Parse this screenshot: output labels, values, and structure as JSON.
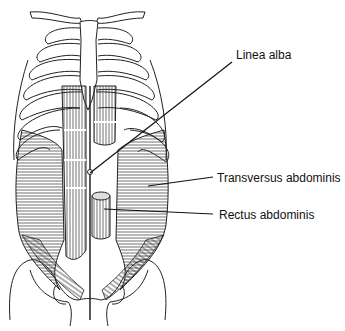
{
  "figure": {
    "labels": [
      {
        "id": "linea-alba",
        "text": "Linea alba",
        "x": 236,
        "y": 48
      },
      {
        "id": "transversus-abdominis",
        "text": "Transversus abdominis",
        "x": 217,
        "y": 171
      },
      {
        "id": "rectus-abdominis",
        "text": "Rectus abdominis",
        "x": 219,
        "y": 208
      }
    ],
    "leaders": [
      {
        "for": "linea-alba",
        "x1": 232,
        "y1": 62,
        "x2": 90,
        "y2": 173
      },
      {
        "for": "transversus-abdominis",
        "x1": 213,
        "y1": 177,
        "x2": 148,
        "y2": 186
      },
      {
        "for": "rectus-abdominis",
        "x1": 213,
        "y1": 214,
        "x2": 104,
        "y2": 209
      }
    ],
    "colors": {
      "line": "#111111",
      "background": "#ffffff"
    }
  }
}
